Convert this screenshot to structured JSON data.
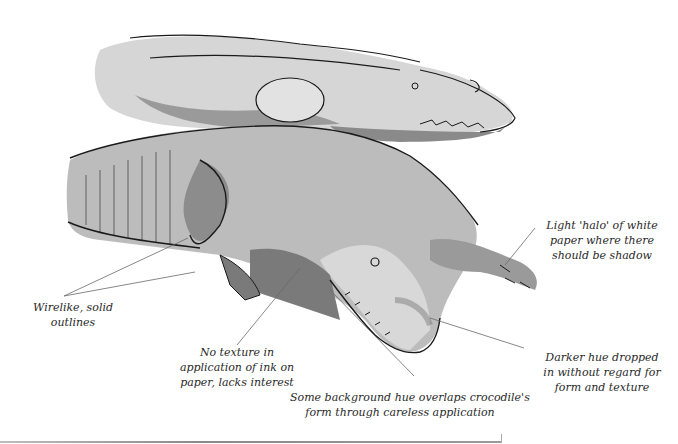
{
  "illustration": {
    "subject": "Two crocodiles in ink and watercolor wash",
    "colors": {
      "wash_light": "#d4d4d4",
      "wash_mid": "#a8a8a8",
      "wash_dark": "#7a7a7a",
      "ink": "#1a1a1a",
      "leader": "#6a6a6a"
    }
  },
  "annotations": [
    {
      "id": "wirelike",
      "lines": [
        "Wirelike, solid",
        "outlines"
      ]
    },
    {
      "id": "no-texture",
      "lines": [
        "No texture in",
        "application of ink on",
        "paper, lacks interest"
      ]
    },
    {
      "id": "background-hue",
      "lines": [
        "Some background hue overlaps crocodile's",
        "form through careless application"
      ]
    },
    {
      "id": "halo",
      "lines": [
        "Light 'halo' of white",
        "paper where there",
        "should be shadow"
      ]
    },
    {
      "id": "darker-hue",
      "lines": [
        "Darker hue dropped",
        "in without regard for",
        "form and texture"
      ]
    }
  ]
}
